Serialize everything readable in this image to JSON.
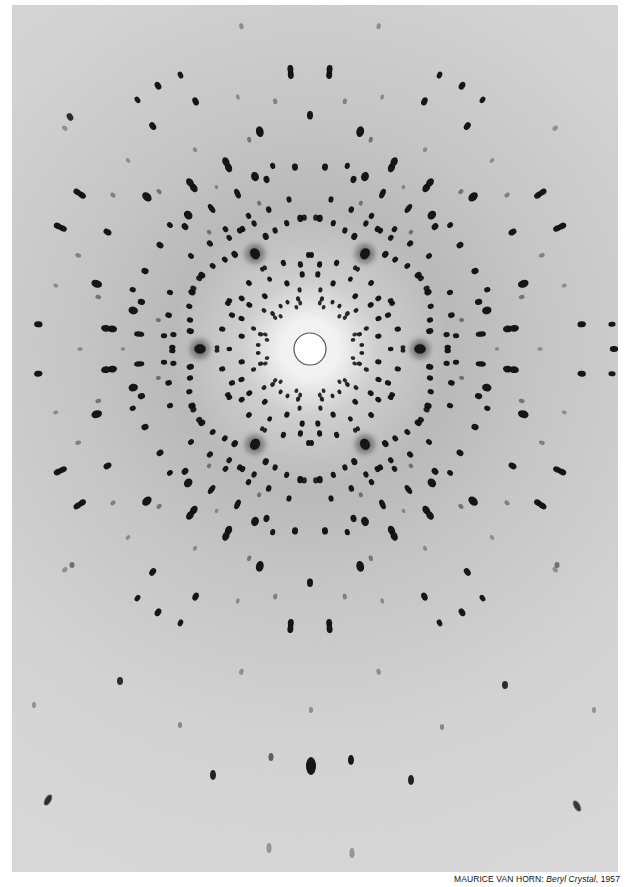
{
  "caption": {
    "artist": "MAURICE VAN HORN:",
    "title": "Beryl Crystal",
    "year": ", 1957"
  },
  "photo": {
    "description": "X-ray diffraction (Laue) pattern of a beryl crystal, six-fold symmetric spot array",
    "background_color": "#d3d3d3",
    "edge_color": "#d8d8d8",
    "halo_dark_color": "#b9b9b9",
    "halo_bright_color": "#f4f4f4",
    "spot_color": "#121212",
    "center": [
      298,
      344
    ],
    "beam_stop": {
      "radius": 16,
      "fill": "#ffffff",
      "stroke": "#555555"
    },
    "symmetry": {
      "fold": 6,
      "mirror": true,
      "base_angle_deg": 0
    }
  },
  "sector_spots": [
    {
      "r": 44,
      "a": 12,
      "s": 2.2,
      "o": 0.85
    },
    {
      "r": 47,
      "a": 18,
      "s": 2.3,
      "o": 0.85
    },
    {
      "r": 52,
      "a": 4.4,
      "s": 2.3,
      "o": 0.9
    },
    {
      "r": 51.5,
      "a": 16.6,
      "s": 2.5,
      "o": 0.9
    },
    {
      "r": 60,
      "a": 20,
      "s": 2.5,
      "o": 0.9
    },
    {
      "r": 69.5,
      "a": 10.6,
      "s": 3,
      "o": 1
    },
    {
      "r": 75,
      "a": 24,
      "s": 3,
      "o": 1
    },
    {
      "r": 80.7,
      "a": 0,
      "s": 2.6,
      "o": 1
    },
    {
      "r": 85,
      "a": 23.5,
      "s": 3,
      "o": 1
    },
    {
      "r": 90,
      "a": 12.8,
      "s": 3,
      "o": 1
    },
    {
      "r": 93,
      "a": 1,
      "s": 2.4,
      "o": 0.9
    },
    {
      "r": 94,
      "a": 29,
      "s": 2.8,
      "o": 0.95
    },
    {
      "r": 110,
      "a": 0,
      "s": 5.5,
      "o": 1,
      "halo": true
    },
    {
      "r": 121,
      "a": 8.5,
      "s": 3.5,
      "o": 1
    },
    {
      "r": 123.5,
      "a": 13.6,
      "s": 3,
      "o": 1
    },
    {
      "r": 128,
      "a": 19.5,
      "s": 3,
      "o": 1
    },
    {
      "r": 131,
      "a": 25.7,
      "s": 3.5,
      "o": 1
    },
    {
      "r": 131.5,
      "a": 27.5,
      "s": 3,
      "o": 0.9
    },
    {
      "r": 137.7,
      "a": 0.7,
      "s": 3,
      "o": 1
    },
    {
      "r": 137.4,
      "a": 6,
      "s": 3,
      "o": 0.95
    },
    {
      "r": 145.4,
      "a": 13.5,
      "s": 3.2,
      "o": 1
    },
    {
      "r": 146.6,
      "a": 5.2,
      "s": 3,
      "o": 1
    },
    {
      "r": 151,
      "a": 22,
      "s": 3,
      "o": 1
    },
    {
      "r": 154.4,
      "a": 10.8,
      "s": 2.4,
      "o": 0.45
    },
    {
      "r": 171.5,
      "a": 5,
      "s": 3.2,
      "o": 1,
      "elong": 1.6
    },
    {
      "r": 175,
      "a": 15.6,
      "s": 3.5,
      "o": 1
    },
    {
      "r": 181,
      "a": 12.3,
      "s": 4.5,
      "o": 1
    },
    {
      "r": 182.5,
      "a": 25.3,
      "s": 3.5,
      "o": 1
    },
    {
      "r": 187,
      "a": 0,
      "s": 2,
      "o": 0.35
    },
    {
      "r": 187,
      "a": 18.5,
      "s": 3,
      "o": 1
    },
    {
      "r": 202,
      "a": 5.8,
      "s": 4,
      "o": 1,
      "double": true
    },
    {
      "r": 218,
      "a": 13.8,
      "s": 2.4,
      "o": 0.45
    },
    {
      "r": 223,
      "a": 17,
      "s": 4.5,
      "o": 1
    },
    {
      "r": 230,
      "a": 0,
      "s": 2.2,
      "o": 0.35
    },
    {
      "r": 233.8,
      "a": 30,
      "s": 3.5,
      "o": 1
    },
    {
      "r": 250,
      "a": 22,
      "s": 2.4,
      "o": 0.4
    },
    {
      "r": 272.8,
      "a": 5.2,
      "s": 3.5,
      "o": 1
    },
    {
      "r": 277.8,
      "a": 26,
      "s": 3.5,
      "o": 1,
      "double": true
    },
    {
      "r": 303,
      "a": 4.7,
      "s": 3,
      "o": 0.95
    },
    {
      "r": 304,
      "a": 0,
      "s": 3.5,
      "o": 1
    },
    {
      "r": 262,
      "a": 14,
      "s": 2.2,
      "o": 0.3
    },
    {
      "r": 330,
      "a": 18,
      "s": 2.5,
      "o": 0.35
    }
  ],
  "extra_spots": [
    {
      "x": 299,
      "y": 761,
      "rx": 5,
      "ry": 9,
      "o": 1
    },
    {
      "x": 259,
      "y": 752,
      "rx": 2.5,
      "ry": 4,
      "o": 0.6
    },
    {
      "x": 339,
      "y": 755,
      "rx": 3,
      "ry": 5,
      "o": 0.95
    },
    {
      "x": 201,
      "y": 770,
      "rx": 3,
      "ry": 5,
      "o": 0.9
    },
    {
      "x": 399,
      "y": 775,
      "rx": 3,
      "ry": 5,
      "o": 0.9
    },
    {
      "x": 36,
      "y": 795,
      "rx": 3,
      "ry": 6,
      "o": 0.85,
      "rot": 30
    },
    {
      "x": 565,
      "y": 801,
      "rx": 3,
      "ry": 6,
      "o": 0.8,
      "rot": -30
    },
    {
      "x": 257,
      "y": 843,
      "rx": 2.5,
      "ry": 5,
      "o": 0.3
    },
    {
      "x": 340,
      "y": 848,
      "rx": 2.5,
      "ry": 5,
      "o": 0.3
    },
    {
      "x": 108,
      "y": 676,
      "rx": 3,
      "ry": 4,
      "o": 0.85
    },
    {
      "x": 493,
      "y": 680,
      "rx": 3,
      "ry": 4,
      "o": 0.85
    },
    {
      "x": 58,
      "y": 112,
      "rx": 3,
      "ry": 4,
      "o": 0.85,
      "rot": -30
    },
    {
      "x": 168,
      "y": 720,
      "rx": 2,
      "ry": 3,
      "o": 0.4
    },
    {
      "x": 430,
      "y": 722,
      "rx": 2,
      "ry": 3,
      "o": 0.4
    },
    {
      "x": 299,
      "y": 705,
      "rx": 2,
      "ry": 3,
      "o": 0.35
    },
    {
      "x": 60,
      "y": 560,
      "rx": 2.5,
      "ry": 3,
      "o": 0.5
    },
    {
      "x": 545,
      "y": 560,
      "rx": 2.5,
      "ry": 3,
      "o": 0.5
    },
    {
      "x": 22,
      "y": 700,
      "rx": 2,
      "ry": 3,
      "o": 0.35
    },
    {
      "x": 582,
      "y": 705,
      "rx": 2,
      "ry": 3,
      "o": 0.35
    }
  ]
}
